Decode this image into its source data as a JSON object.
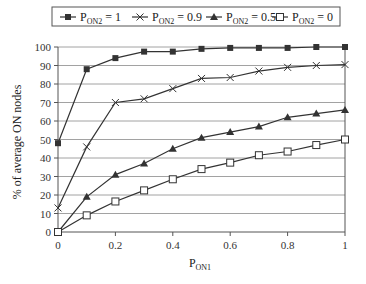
{
  "chart_data": {
    "type": "line",
    "title": "",
    "xlabel": "P_ON1",
    "ylabel": "% of average ON nodes",
    "xlim": [
      0,
      1
    ],
    "ylim": [
      0,
      100
    ],
    "grid": {
      "horizontal": true,
      "vertical": false
    },
    "legend_position": "top",
    "x": [
      0,
      0.1,
      0.2,
      0.3,
      0.4,
      0.5,
      0.6,
      0.7,
      0.8,
      0.9,
      1.0
    ],
    "x_ticks": [
      "0",
      "0.2",
      "0.4",
      "0.6",
      "0.8",
      "1"
    ],
    "y_ticks": [
      "0",
      "10",
      "20",
      "30",
      "40",
      "50",
      "60",
      "70",
      "80",
      "90",
      "100"
    ],
    "series": [
      {
        "name": "P_ON2 = 1",
        "label_main": "P",
        "label_sub": "ON2",
        "label_rest": " = 1",
        "marker": "filled-square",
        "values": [
          48,
          88,
          94,
          97.5,
          97.5,
          99,
          99.5,
          99.5,
          99.5,
          100,
          100
        ]
      },
      {
        "name": "P_ON2 = 0.9",
        "label_main": "P",
        "label_sub": "ON2",
        "label_rest": " = 0.9",
        "marker": "x",
        "values": [
          13,
          46,
          70,
          72,
          77.5,
          83,
          83.5,
          87,
          89,
          90,
          90.5
        ]
      },
      {
        "name": "P_ON2 = 0.5",
        "label_main": "P",
        "label_sub": "ON2",
        "label_rest": " = 0.5",
        "marker": "filled-triangle",
        "values": [
          0,
          19,
          31,
          37,
          45,
          51,
          54,
          57,
          62,
          64,
          66
        ]
      },
      {
        "name": "P_ON2 = 0",
        "label_main": "P",
        "label_sub": "ON2",
        "label_rest": " = 0",
        "marker": "open-square",
        "values": [
          0,
          9,
          16.5,
          22.5,
          28.5,
          34,
          37.5,
          41.5,
          43.5,
          47,
          50
        ]
      }
    ]
  },
  "axes": {
    "x_title_main": "P",
    "x_title_sub": "ON1",
    "y_title": "% of average ON nodes"
  },
  "colors": {
    "line": "#333333",
    "grid": "#8a8a8a",
    "axis": "#555555"
  }
}
